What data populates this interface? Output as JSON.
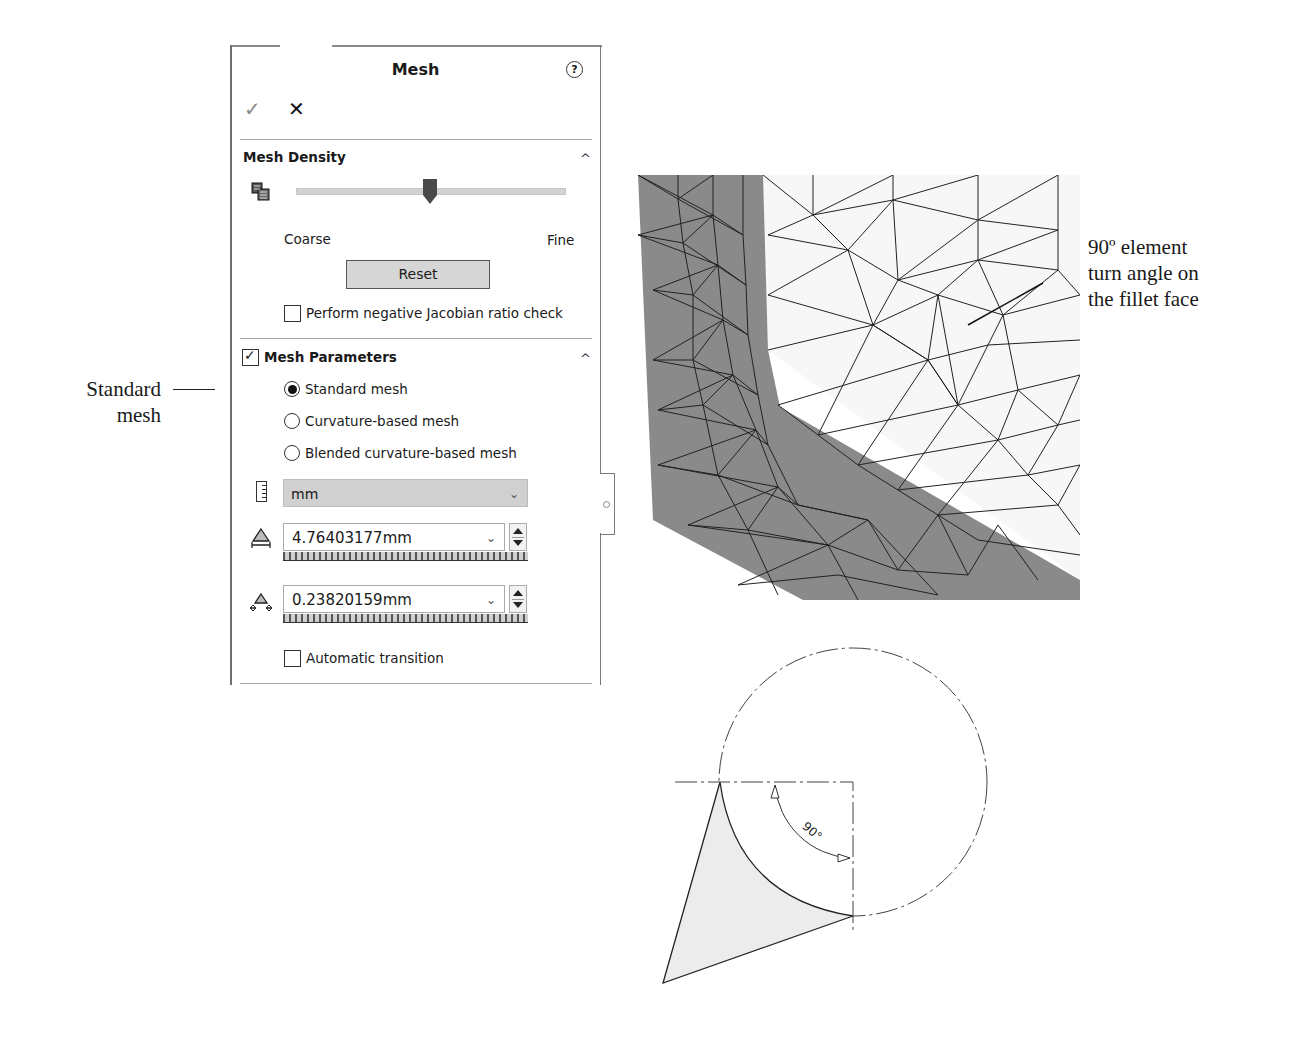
{
  "panel": {
    "title": "Mesh",
    "help_glyph": "?",
    "ok_glyph": "✓",
    "cancel_glyph": "✕",
    "mesh_density": {
      "title": "Mesh Density",
      "collapse_glyph": "^",
      "slider_min_label": "Coarse",
      "slider_max_label": "Fine",
      "slider_position": 50,
      "reset_label": "Reset",
      "jacobian_check_label": "Perform negative Jacobian ratio check",
      "jacobian_checked": false
    },
    "mesh_parameters": {
      "title": "Mesh Parameters",
      "enabled": true,
      "collapse_glyph": "^",
      "options": [
        {
          "label": "Standard mesh",
          "selected": true
        },
        {
          "label": "Curvature-based mesh",
          "selected": false
        },
        {
          "label": "Blended curvature-based mesh",
          "selected": false
        }
      ],
      "unit": "mm",
      "global_size": "4.76403177mm",
      "tolerance": "0.23820159mm",
      "automatic_transition_label": "Automatic transition",
      "automatic_transition_checked": false
    }
  },
  "annotations": {
    "standard_mesh_line1": "Standard",
    "standard_mesh_line2": "mesh",
    "fillet_line1": "90º element",
    "fillet_line2": "turn angle on",
    "fillet_line3": "the fillet face",
    "angle_label": "90°"
  },
  "colors": {
    "mesh_dark_face": "#8a8a8a",
    "mesh_light_face": "#f7f7f7",
    "select_bg": "#d0d0d0",
    "slider_thumb": "#4a4a4a"
  }
}
